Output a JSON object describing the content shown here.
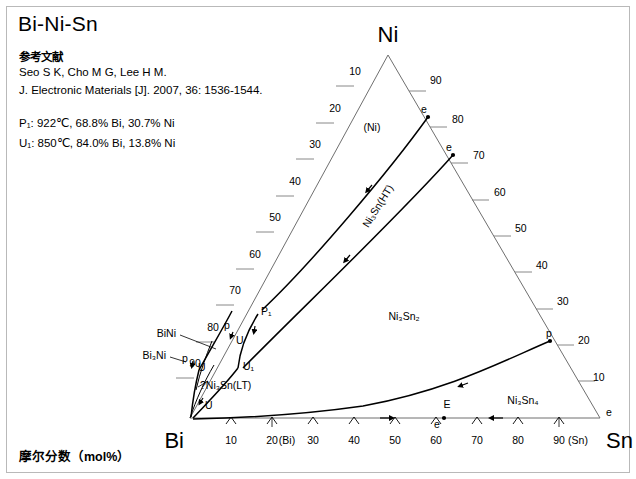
{
  "document": {
    "title": "Bi-Ni-Sn",
    "axis_caption": "摩尔分数（mol%）"
  },
  "reference": {
    "heading": "参考文献",
    "authors": "Seo S K, Cho M G, Lee H M.",
    "journal": "J. Electronic Materials [J]. 2007, 36: 1536-1544."
  },
  "invariant_points": [
    {
      "label": "P1",
      "text": "P₁: 922℃, 68.8% Bi, 30.7% Ni"
    },
    {
      "label": "U1",
      "text": "U₁: 850℃, 84.0% Bi, 13.8% Ni"
    }
  ],
  "triangle": {
    "vertices": [
      {
        "name": "Bi",
        "label": "Bi",
        "x": 190,
        "y": 418
      },
      {
        "name": "Ni",
        "label": "Ni",
        "x": 388,
        "y": 55
      },
      {
        "name": "Sn",
        "label": "Sn",
        "x": 600,
        "y": 418
      }
    ]
  },
  "axes": {
    "bottom": {
      "name": "Bi-Sn",
      "ticks": [
        "10",
        "20",
        "30",
        "40",
        "50",
        "60",
        "70",
        "80",
        "90"
      ]
    },
    "left": {
      "name": "Bi-Ni",
      "ticks": [
        "10",
        "20",
        "30",
        "40",
        "50",
        "60",
        "70",
        "80",
        "90"
      ]
    },
    "right": {
      "name": "Ni-Sn",
      "ticks": [
        "90",
        "80",
        "70",
        "60",
        "50",
        "40",
        "30",
        "20",
        "10"
      ]
    }
  },
  "phase_fields": [
    {
      "name": "ni-solid-solution",
      "label": "(Ni)",
      "x": 372,
      "y": 127
    },
    {
      "name": "ni3sn-ht",
      "label": "Ni₃Sn(HT)",
      "x": 381,
      "y": 208,
      "rotation": -58
    },
    {
      "name": "ni3sn2",
      "label": "Ni₃Sn₂",
      "x": 404,
      "y": 316
    },
    {
      "name": "ni3sn4",
      "label": "Ni₃Sn₄",
      "x": 523,
      "y": 400
    },
    {
      "name": "ni3sn-lt",
      "label": "?Ni₃Sn(LT)",
      "x": 200,
      "y": 385
    },
    {
      "name": "bini",
      "label": "BiNi",
      "x": 178,
      "y": 333
    },
    {
      "name": "bi3ni",
      "label": "Bi₃Ni",
      "x": 167,
      "y": 355
    },
    {
      "name": "bi-solid-solution",
      "label": "(Bi)",
      "x": 249,
      "y": 441
    },
    {
      "name": "sn-solid-solution",
      "label": "(Sn)",
      "x": 573,
      "y": 441
    }
  ],
  "point_markers": [
    {
      "name": "p1-point",
      "label": "P₁",
      "x": 258,
      "y": 311
    },
    {
      "name": "u1-point",
      "label": "U₁",
      "x": 240,
      "y": 364
    },
    {
      "name": "u-point-a",
      "label": "U",
      "x": 234,
      "y": 340
    },
    {
      "name": "u-point-b",
      "label": "U",
      "x": 196,
      "y": 368
    },
    {
      "name": "u-point-c",
      "label": "U",
      "x": 204,
      "y": 405
    },
    {
      "name": "p-point-a",
      "label": "p",
      "x": 228,
      "y": 325
    },
    {
      "name": "p-point-b",
      "label": "p",
      "x": 186,
      "y": 358
    },
    {
      "name": "p-point-right",
      "label": "p",
      "x": 552,
      "y": 336
    },
    {
      "name": "e-point-ni-sn-80",
      "label": "e",
      "x": 430,
      "y": 114
    },
    {
      "name": "e-point-ni-sn-70",
      "label": "e",
      "x": 455,
      "y": 152
    },
    {
      "name": "e-point-sn-corner",
      "label": "e",
      "x": 604,
      "y": 415
    },
    {
      "name": "e-point-bottom",
      "label": "e",
      "x": 444,
      "y": 423
    },
    {
      "name": "eutectic-E",
      "label": "E",
      "x": 447,
      "y": 410
    }
  ]
}
